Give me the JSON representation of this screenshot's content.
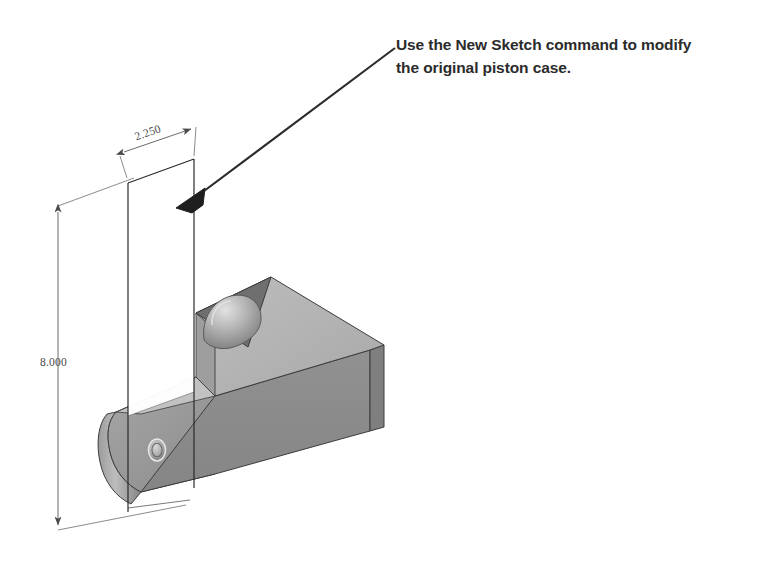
{
  "canvas": {
    "width": 757,
    "height": 570,
    "background": "#ffffff"
  },
  "annotation": {
    "line1": "Use the New Sketch command to modify",
    "line2": "the original piston case.",
    "color": "#2b2b2b",
    "leader": {
      "from_x": 395,
      "from_y": 48,
      "to_x": 178,
      "to_y": 207
    }
  },
  "dimensions": {
    "vertical": {
      "value": "8.000",
      "axis": "vertical",
      "from_y": 212,
      "to_y": 525,
      "x": 58
    },
    "horizontal": {
      "value": "2.250",
      "axis": "isometric-horizontal",
      "from_x": 124,
      "from_y": 152,
      "to_x": 190,
      "to_y": 130
    }
  },
  "sketch_plane": {
    "name": "new-sketch-rectangle",
    "stroke": "#2a2a2a",
    "fill": "#ffffff",
    "corners": "128,183 194,159 194,392 128,416"
  },
  "solid": {
    "name": "piston-case-solid",
    "top_face_color": "#b3b3b3",
    "front_face_color": "#8b8b8b",
    "right_face_color": "#9a9a9a",
    "notch_color": "#6f6f6f",
    "edge_color": "#3c3c3c",
    "features": {
      "dome_recess": "spherical-dome",
      "thru_hole": "small-circular-hole"
    }
  },
  "icons": {
    "arrow": "arrowhead-icon",
    "dim_arrow": "dimension-arrow-icon"
  }
}
